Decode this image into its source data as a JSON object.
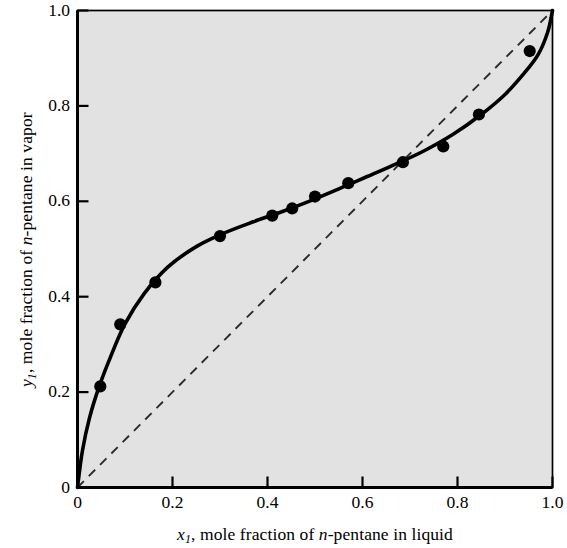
{
  "chart_data": {
    "type": "scatter",
    "title": "",
    "xlabel": "x1, mole fraction of n-pentane in liquid",
    "ylabel": "y1, mole fraction of n-pentane in vapor",
    "xlim": [
      0,
      1.0
    ],
    "ylim": [
      0,
      1.0
    ],
    "grid": false,
    "legend": "none",
    "xticks": [
      "0",
      "0.2",
      "0.4",
      "0.6",
      "0.8",
      "1.0"
    ],
    "xtick_values": [
      0,
      0.2,
      0.4,
      0.6,
      0.8,
      1.0
    ],
    "yticks": [
      "0",
      "0.2",
      "0.4",
      "0.6",
      "0.8",
      "1.0"
    ],
    "ytick_values": [
      0,
      0.2,
      0.4,
      0.6,
      0.8,
      1.0
    ],
    "series": [
      {
        "name": "experimental data",
        "marker": "filled-circle",
        "color": "#000000",
        "x": [
          0.048,
          0.09,
          0.164,
          0.3,
          0.41,
          0.452,
          0.5,
          0.57,
          0.685,
          0.77,
          0.845,
          0.952
        ],
        "y": [
          0.212,
          0.342,
          0.43,
          0.527,
          0.57,
          0.585,
          0.61,
          0.638,
          0.682,
          0.715,
          0.782,
          0.915
        ]
      },
      {
        "name": "equilibrium curve",
        "marker": "none",
        "linestyle": "solid",
        "color": "#000000",
        "x": [
          0.0,
          0.01,
          0.025,
          0.045,
          0.07,
          0.1,
          0.14,
          0.19,
          0.25,
          0.31,
          0.37,
          0.43,
          0.49,
          0.55,
          0.61,
          0.67,
          0.73,
          0.79,
          0.85,
          0.9,
          0.94,
          0.97,
          0.99,
          1.0
        ],
        "y": [
          0.0,
          0.075,
          0.145,
          0.21,
          0.275,
          0.343,
          0.406,
          0.462,
          0.505,
          0.534,
          0.557,
          0.578,
          0.601,
          0.626,
          0.652,
          0.678,
          0.706,
          0.74,
          0.782,
          0.824,
          0.868,
          0.908,
          0.955,
          1.0
        ]
      },
      {
        "name": "45 degree diagonal",
        "marker": "none",
        "linestyle": "dashed",
        "color": "#1a1a1a",
        "x": [
          0.0,
          1.0
        ],
        "y": [
          0.0,
          1.0
        ]
      }
    ],
    "annotations": []
  },
  "axes": {
    "y_title_parts": {
      "symbol": "y",
      "subscript": "1",
      "text_a": ", mole fraction of ",
      "italic_n": "n",
      "text_b": "-pentane in vapor"
    },
    "x_title_parts": {
      "symbol": "x",
      "subscript": "1",
      "text_a": ", mole fraction of ",
      "italic_n": "n",
      "text_b": "-pentane in liquid"
    }
  },
  "style": {
    "plot_background": "#e2e2e2",
    "axis_color": "#000000",
    "curve_color": "#000000",
    "dashed_color": "#2a2a2a",
    "page_background": "#ffffff"
  }
}
